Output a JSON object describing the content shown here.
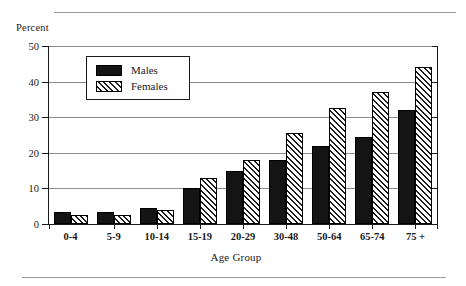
{
  "figure": {
    "ylabel_title": "Percent",
    "xaxis_title": "Age Group",
    "rules": {
      "color": "#9a9a9a"
    }
  },
  "legend": {
    "position": "inside-upper-left",
    "entries": [
      {
        "label": "Males",
        "swatch": "solid-black-swatch",
        "color": "#141414"
      },
      {
        "label": "Females",
        "swatch": "diagonal-hatch-swatch",
        "color": "#ffffff"
      }
    ]
  },
  "chart_data": {
    "type": "bar",
    "title": "",
    "subtitle": "",
    "xlabel": "Age Group",
    "ylabel": "Percent",
    "ylim": [
      0,
      50
    ],
    "yticks": [
      0,
      10,
      20,
      30,
      40,
      50
    ],
    "ytick_labels": [
      "0",
      "10",
      "20",
      "30",
      "40",
      "50"
    ],
    "grid": true,
    "grid_axis": "y",
    "legend_position": "inside upper left",
    "categories": [
      "0-4",
      "5-9",
      "10-14",
      "15-19",
      "20-29",
      "30-48",
      "50-64",
      "65-74",
      "75 +"
    ],
    "series": [
      {
        "name": "Males",
        "values": [
          3.5,
          3.5,
          4.5,
          10,
          15,
          18,
          22,
          24.5,
          32
        ]
      },
      {
        "name": "Females",
        "values": [
          2.5,
          2.5,
          4,
          13,
          18,
          25.5,
          32.5,
          37,
          44
        ]
      }
    ]
  }
}
